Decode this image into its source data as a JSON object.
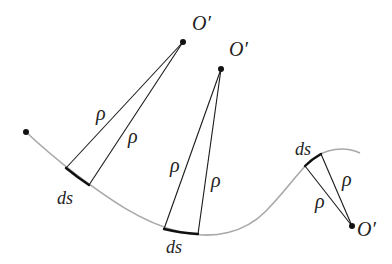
{
  "diagram": {
    "labels": {
      "center": "O′",
      "radius": "ρ",
      "arc_element": "ds"
    },
    "centers": [
      {
        "id": "O1",
        "label": "O′"
      },
      {
        "id": "O2",
        "label": "O′"
      },
      {
        "id": "O3",
        "label": "O′"
      }
    ],
    "segments": [
      {
        "id": "seg1",
        "ds_label": "ds",
        "rho_labels": [
          "ρ",
          "ρ"
        ]
      },
      {
        "id": "seg2",
        "ds_label": "ds",
        "rho_labels": [
          "ρ",
          "ρ"
        ]
      },
      {
        "id": "seg3",
        "ds_label": "ds",
        "rho_labels": [
          "ρ",
          "ρ"
        ]
      }
    ],
    "colors": {
      "curve": "#a8a8a8",
      "lines": "#1a1a1a",
      "text": "#222222"
    }
  }
}
